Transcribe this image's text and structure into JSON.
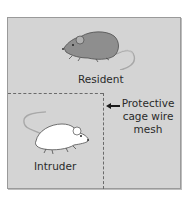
{
  "diagram": {
    "type": "resident-intruder-cage",
    "regions": [
      {
        "id": "resident-area",
        "label": "Resident",
        "mouse_color": "gray"
      },
      {
        "id": "intruder-area",
        "label": "Intruder",
        "mouse_color": "white"
      }
    ],
    "annotation": {
      "lines": [
        "Protective",
        "cage wire",
        "mesh"
      ],
      "points_to": "dashed-divider"
    },
    "colors": {
      "cage_background": "#d4d4d4",
      "resident_mouse": "#8e8e8e",
      "intruder_mouse": "#ffffff",
      "divider": "#6a6a6a"
    }
  }
}
